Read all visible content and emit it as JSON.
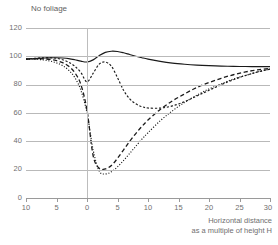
{
  "chart_data": {
    "type": "line",
    "title": "No foliage",
    "xlabel": "Horizontal distance as a multiple of height H",
    "xlabel_line1": "Horizontal distance",
    "xlabel_line2": "as a multiple of height H",
    "ylabel": "",
    "xlim": [
      -10,
      30
    ],
    "ylim": [
      0,
      120
    ],
    "grid": true,
    "legend": "none",
    "xticks": [
      -10,
      -5,
      0,
      5,
      10,
      15,
      20,
      25,
      30
    ],
    "xticklabels": [
      "10",
      "5",
      "0",
      "5",
      "10",
      "15",
      "20",
      "25",
      "30"
    ],
    "yticks": [
      0,
      20,
      40,
      60,
      80,
      100,
      120
    ],
    "yticklabels": [
      "0",
      "20",
      "40",
      "60",
      "80",
      "100",
      "120"
    ],
    "reference_line_x": 0,
    "x": [
      -10,
      -9,
      -8,
      -7,
      -6,
      -5,
      -4,
      -3,
      -2,
      -1,
      0,
      1,
      2,
      3,
      4,
      5,
      6,
      7,
      8,
      9,
      10,
      12,
      14,
      16,
      18,
      20,
      22,
      24,
      26,
      28,
      30
    ],
    "series": [
      {
        "name": "solid",
        "style": "solid",
        "values": [
          98,
          98.3,
          98.6,
          98.8,
          99,
          99,
          98.8,
          98.4,
          97.6,
          96.6,
          96,
          97.5,
          100.5,
          102.8,
          103.6,
          103.4,
          102.5,
          101.3,
          100.1,
          99,
          98,
          96.4,
          95.2,
          94.4,
          93.8,
          93.4,
          93.1,
          92.9,
          92.8,
          92.7,
          92.7
        ]
      },
      {
        "name": "short-dash",
        "style": "short-dash",
        "values": [
          98,
          98.4,
          98.8,
          99,
          99,
          98.6,
          97.6,
          95.8,
          93,
          88.5,
          82,
          88,
          94.5,
          96,
          93,
          85,
          76,
          70,
          66.5,
          64.5,
          63.5,
          63.5,
          65,
          68,
          72,
          76,
          80,
          83.5,
          86.5,
          89,
          91
        ]
      },
      {
        "name": "dashed",
        "style": "dashed",
        "values": [
          98,
          98.2,
          98.3,
          98.2,
          97.8,
          97,
          95.5,
          93,
          88.5,
          80,
          62,
          30,
          21,
          20.5,
          23,
          28,
          34,
          40,
          45.5,
          50.5,
          55,
          62.5,
          68.5,
          73.5,
          78,
          81.5,
          84.5,
          87,
          89,
          90.5,
          91.5
        ]
      },
      {
        "name": "dotted",
        "style": "dotted",
        "values": [
          98,
          98,
          97.8,
          97.4,
          96.6,
          95.4,
          93.4,
          90.2,
          85,
          76,
          60,
          34,
          19,
          17,
          18.5,
          22,
          26.5,
          31.5,
          36.5,
          41.5,
          46,
          54.5,
          61.5,
          67.5,
          72.5,
          77,
          80.5,
          84,
          86.5,
          89,
          91
        ]
      }
    ]
  },
  "axis": {
    "ytick_labels": [
      "120",
      "100",
      "80",
      "60",
      "40",
      "20",
      "0"
    ],
    "xtick_labels": [
      "10",
      "5",
      "0",
      "5",
      "10",
      "15",
      "20",
      "25",
      "30"
    ]
  },
  "colors": {
    "line": "#1a1a1a",
    "grid": "#b9b9b9",
    "axis": "#9a9a9a",
    "text": "#6f6f6f",
    "background": "#ffffff"
  }
}
